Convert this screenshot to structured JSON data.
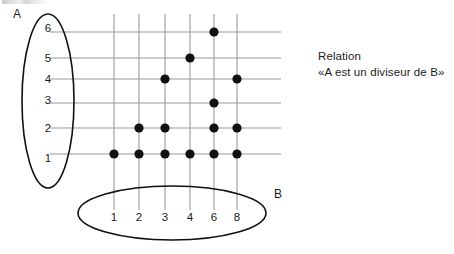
{
  "figure": {
    "title_caption": {
      "line1": "Relation",
      "line2": "«A est un diviseur de B»"
    },
    "set_a": {
      "label": "A",
      "elements": [
        "6",
        "5",
        "4",
        "3",
        "2",
        "1"
      ]
    },
    "set_b": {
      "label": "B",
      "elements": [
        "1",
        "2",
        "3",
        "4",
        "6",
        "8"
      ]
    }
  },
  "chart_data": {
    "type": "scatter",
    "title": "Relation «A est un diviseur de B»",
    "xlabel": "B",
    "ylabel": "A",
    "x": [
      1,
      2,
      3,
      4,
      6,
      8
    ],
    "y": [
      1,
      2,
      3,
      4,
      5,
      6
    ],
    "xtick_labels": [
      "1",
      "2",
      "3",
      "4",
      "6",
      "8"
    ],
    "ytick_labels": [
      "1",
      "2",
      "3",
      "4",
      "5",
      "6"
    ],
    "grid": true,
    "legend": "none",
    "relation": "A divides B",
    "points": [
      {
        "a": 1,
        "b": 1
      },
      {
        "a": 1,
        "b": 2
      },
      {
        "a": 1,
        "b": 3
      },
      {
        "a": 1,
        "b": 4
      },
      {
        "a": 1,
        "b": 6
      },
      {
        "a": 1,
        "b": 8
      },
      {
        "a": 2,
        "b": 2
      },
      {
        "a": 2,
        "b": 3
      },
      {
        "a": 2,
        "b": 6
      },
      {
        "a": 2,
        "b": 8
      },
      {
        "a": 3,
        "b": 6
      },
      {
        "a": 4,
        "b": 3
      },
      {
        "a": 4,
        "b": 8
      },
      {
        "a": 5,
        "b": 4
      },
      {
        "a": 6,
        "b": 6
      }
    ],
    "matrix": {
      "rows": [
        "6",
        "5",
        "4",
        "3",
        "2",
        "1"
      ],
      "columns": [
        "1",
        "2",
        "3",
        "4",
        "6",
        "8"
      ],
      "values": [
        [
          0,
          0,
          0,
          0,
          1,
          0
        ],
        [
          0,
          0,
          0,
          1,
          0,
          0
        ],
        [
          0,
          0,
          1,
          0,
          0,
          1
        ],
        [
          0,
          0,
          0,
          0,
          1,
          0
        ],
        [
          0,
          1,
          1,
          0,
          1,
          1
        ],
        [
          1,
          1,
          1,
          1,
          1,
          1
        ]
      ]
    }
  },
  "colors": {
    "dot": "#111111",
    "gridline": "#9a9a9a",
    "outline": "#111111",
    "text": "#1c1c1c",
    "background": "#ffffff"
  }
}
